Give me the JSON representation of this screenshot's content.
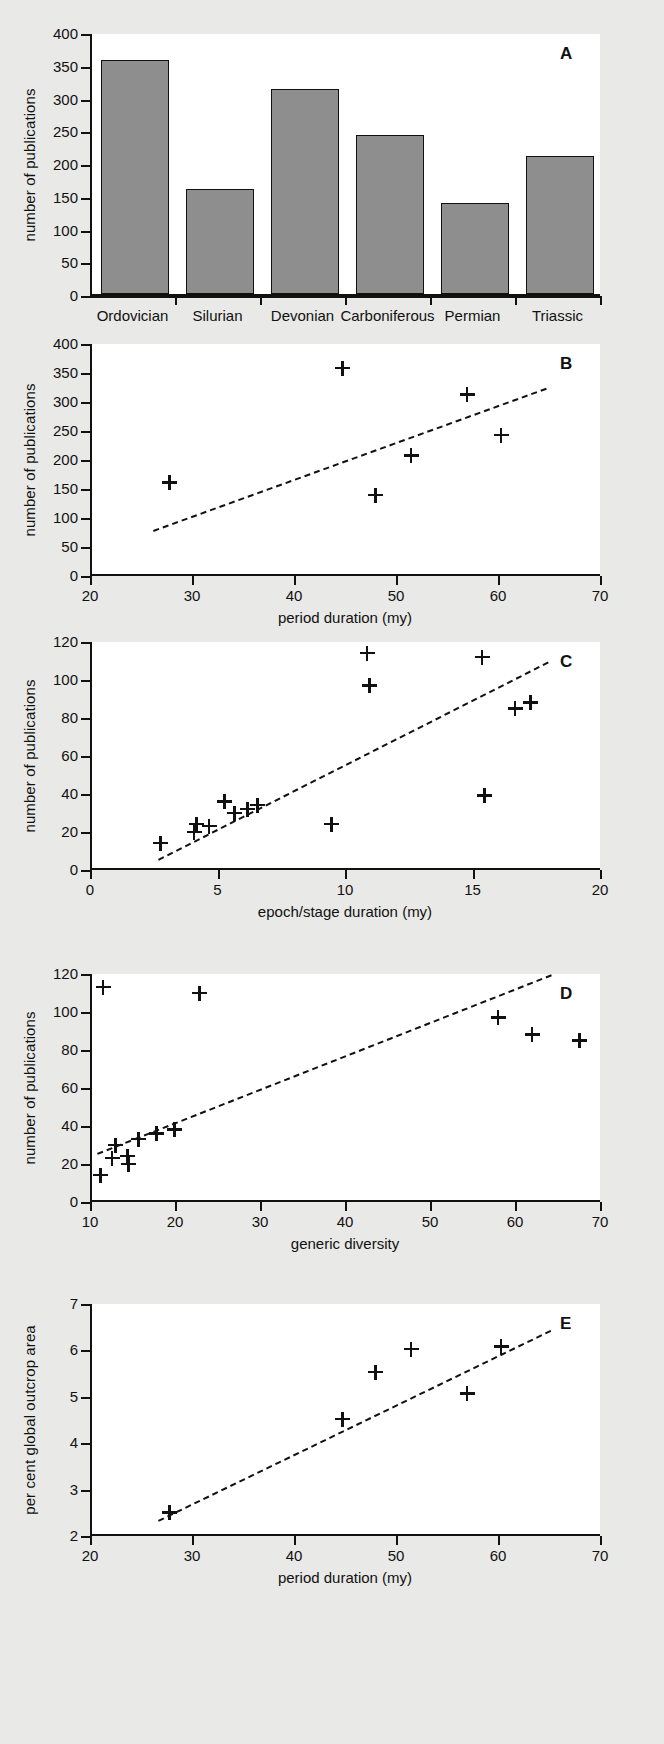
{
  "figure": {
    "panels": [
      "A",
      "B",
      "C",
      "D",
      "E"
    ],
    "background": "#e9e9e7",
    "bar_fill": "#8e8e8e",
    "ink": "#111111"
  },
  "chart_data": [
    {
      "panel": "A",
      "type": "bar",
      "title": "",
      "xlabel": "",
      "ylabel": "number of publications",
      "categories": [
        "Ordovician",
        "Silurian",
        "Devonian",
        "Carboniferous",
        "Permian",
        "Triassic"
      ],
      "values": [
        358,
        161,
        313,
        243,
        139,
        210
      ],
      "ylim": [
        0,
        400
      ],
      "yticks": [
        0,
        50,
        100,
        150,
        200,
        250,
        300,
        350,
        400
      ],
      "grid": false,
      "legend": "none"
    },
    {
      "panel": "B",
      "type": "scatter",
      "title": "",
      "xlabel": "period duration (my)",
      "ylabel": "number of publications",
      "xlim": [
        20,
        70
      ],
      "ylim": [
        0,
        400
      ],
      "xticks": [
        20,
        30,
        40,
        50,
        60,
        70
      ],
      "yticks": [
        0,
        50,
        100,
        150,
        200,
        250,
        300,
        350,
        400
      ],
      "points": [
        {
          "x": 27.6,
          "y": 161
        },
        {
          "x": 44.6,
          "y": 358
        },
        {
          "x": 47.8,
          "y": 139
        },
        {
          "x": 51.3,
          "y": 207
        },
        {
          "x": 56.8,
          "y": 313
        },
        {
          "x": 60.1,
          "y": 243
        }
      ],
      "trendline": {
        "x0": 26.0,
        "y0": 80,
        "x1": 64.5,
        "y1": 325,
        "style": "dashed"
      },
      "grid": false,
      "legend": "none"
    },
    {
      "panel": "C",
      "type": "scatter",
      "title": "",
      "xlabel": "epoch/stage duration (my)",
      "ylabel": "number of publications",
      "xlim": [
        0,
        20
      ],
      "ylim": [
        0,
        120
      ],
      "xticks": [
        0,
        5,
        10,
        15,
        20
      ],
      "yticks": [
        0,
        20,
        40,
        60,
        80,
        100,
        120
      ],
      "points": [
        {
          "x": 2.7,
          "y": 14
        },
        {
          "x": 4.0,
          "y": 20
        },
        {
          "x": 4.1,
          "y": 24
        },
        {
          "x": 4.6,
          "y": 23
        },
        {
          "x": 5.2,
          "y": 36
        },
        {
          "x": 5.6,
          "y": 30
        },
        {
          "x": 6.1,
          "y": 32
        },
        {
          "x": 6.5,
          "y": 34
        },
        {
          "x": 9.4,
          "y": 24
        },
        {
          "x": 10.8,
          "y": 114
        },
        {
          "x": 10.9,
          "y": 97
        },
        {
          "x": 15.3,
          "y": 112
        },
        {
          "x": 15.4,
          "y": 39
        },
        {
          "x": 16.6,
          "y": 85
        },
        {
          "x": 17.2,
          "y": 88
        }
      ],
      "trendline": {
        "x0": 2.6,
        "y0": 6,
        "x1": 17.9,
        "y1": 110,
        "style": "dashed"
      },
      "grid": false,
      "legend": "none"
    },
    {
      "panel": "D",
      "type": "scatter",
      "title": "",
      "xlabel": "generic diversity",
      "ylabel": "number of publications",
      "xlim": [
        10,
        70
      ],
      "ylim": [
        0,
        120
      ],
      "xticks": [
        10,
        20,
        30,
        40,
        50,
        60,
        70
      ],
      "yticks": [
        0,
        20,
        40,
        60,
        80,
        100,
        120
      ],
      "points": [
        {
          "x": 11.0,
          "y": 14
        },
        {
          "x": 11.3,
          "y": 113
        },
        {
          "x": 12.4,
          "y": 23
        },
        {
          "x": 12.8,
          "y": 30
        },
        {
          "x": 14.2,
          "y": 24
        },
        {
          "x": 14.3,
          "y": 20
        },
        {
          "x": 15.5,
          "y": 33
        },
        {
          "x": 17.6,
          "y": 36
        },
        {
          "x": 19.7,
          "y": 38
        },
        {
          "x": 22.7,
          "y": 110
        },
        {
          "x": 57.8,
          "y": 97
        },
        {
          "x": 61.8,
          "y": 88
        },
        {
          "x": 67.4,
          "y": 85
        }
      ],
      "trendline": {
        "x0": 10.6,
        "y0": 26,
        "x1": 64.0,
        "y1": 120,
        "style": "dashed"
      },
      "grid": false,
      "legend": "none"
    },
    {
      "panel": "E",
      "type": "scatter",
      "title": "",
      "xlabel": "period duration (my)",
      "ylabel": "per cent global outcrop area",
      "xlim": [
        20,
        70
      ],
      "ylim": [
        2,
        7
      ],
      "xticks": [
        20,
        30,
        40,
        50,
        60,
        70
      ],
      "yticks": [
        2,
        3,
        4,
        5,
        6,
        7
      ],
      "points": [
        {
          "x": 27.6,
          "y": 2.5
        },
        {
          "x": 44.6,
          "y": 4.52
        },
        {
          "x": 47.8,
          "y": 5.53
        },
        {
          "x": 51.3,
          "y": 6.03
        },
        {
          "x": 56.8,
          "y": 5.07
        },
        {
          "x": 60.1,
          "y": 6.08
        }
      ],
      "trendline": {
        "x0": 26.5,
        "y0": 2.35,
        "x1": 65.0,
        "y1": 6.45,
        "style": "dashed"
      },
      "grid": false,
      "legend": "none"
    }
  ]
}
